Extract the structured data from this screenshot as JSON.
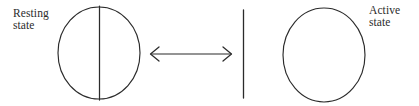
{
  "figure": {
    "background_color": "#ffffff",
    "stroke_color": "#2b2b2b",
    "width": 419,
    "height": 106
  },
  "labels": {
    "resting": {
      "line1": "Resting",
      "line2": "state"
    },
    "active": {
      "line1": "Active",
      "line2": "state"
    }
  },
  "shapes": {
    "left_circle": {
      "name": "resting-state-circle",
      "cx": 99,
      "cy": 53,
      "rx": 41,
      "ry": 46,
      "filled": false
    },
    "left_chord": {
      "name": "resting-state-divider-line",
      "x": 99,
      "y1": 6,
      "y2": 100
    },
    "arrow": {
      "name": "bidirectional-arrow",
      "x1": 150,
      "x2": 232,
      "y": 54,
      "heads": "both"
    },
    "separator_bar": {
      "name": "vertical-separator-bar",
      "x": 243,
      "y1": 10,
      "y2": 98
    },
    "right_circle": {
      "name": "active-state-circle",
      "cx": 324,
      "cy": 55,
      "rx": 41,
      "ry": 47,
      "filled": false
    }
  }
}
